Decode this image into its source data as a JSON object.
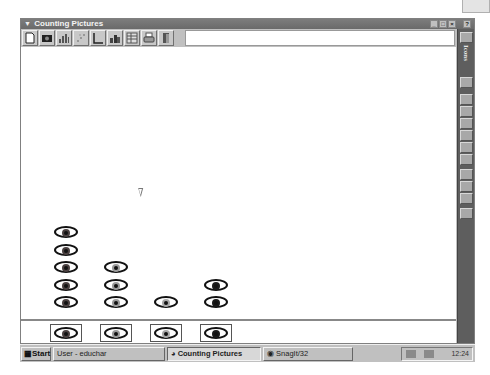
{
  "window": {
    "title": "Counting Pictures",
    "controls": [
      "minimize",
      "maximize",
      "close"
    ],
    "extra_control": "help"
  },
  "toolbar": {
    "buttons": [
      {
        "name": "new-icon"
      },
      {
        "name": "camera-icon"
      },
      {
        "name": "bar-chart-icon"
      },
      {
        "name": "scatter-icon"
      },
      {
        "name": "axis-icon"
      },
      {
        "name": "pictograph-icon"
      },
      {
        "name": "table-icon"
      },
      {
        "name": "print-icon"
      },
      {
        "name": "exit-door-icon"
      }
    ],
    "field_value": ""
  },
  "sidebar": {
    "label": "Icons",
    "buttons": [
      "palette-icon",
      "select-icon",
      "text-icon",
      "cross-icon",
      "frame-icon",
      "magnify-icon",
      "paint-icon",
      "stamp-icon",
      "grid-icon",
      "line-icon",
      "erase-icon",
      "info-icon"
    ]
  },
  "graph": {
    "colors": {
      "brown": "#4a4040",
      "blue": "#9a9a9a",
      "green": "#a8a8a8",
      "black": "#1a1a1a"
    },
    "columns": [
      {
        "category": "brown",
        "count": 5
      },
      {
        "category": "blue",
        "count": 3
      },
      {
        "category": "green",
        "count": 1
      },
      {
        "category": "black",
        "count": 2
      }
    ]
  },
  "taskbar": {
    "start_label": "Start",
    "tasks": [
      {
        "label": "User - educhar",
        "active": false
      },
      {
        "label": "Counting Pictures",
        "active": true
      },
      {
        "label": "SnagIt/32",
        "active": false
      }
    ],
    "clock": "12:24"
  }
}
